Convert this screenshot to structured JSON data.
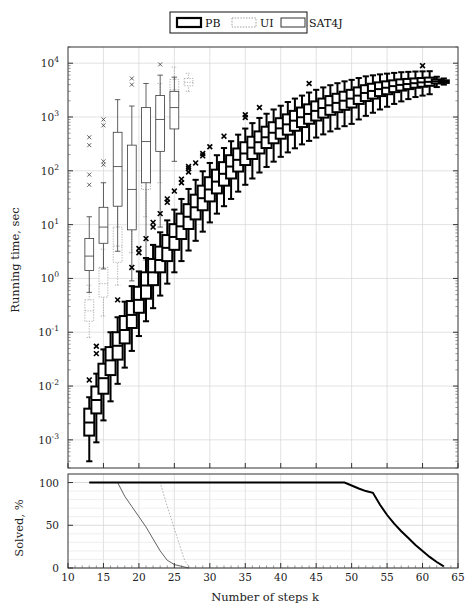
{
  "chart_data": {
    "type": "box",
    "title": "",
    "xlabel": "Number of steps k",
    "ylabel": "Running time, sec",
    "xlim": [
      10,
      65
    ],
    "xticks": [
      10,
      15,
      20,
      25,
      30,
      35,
      40,
      45,
      50,
      55,
      60,
      65
    ],
    "xticklabels": [
      "10",
      "15",
      "20",
      "25",
      "30",
      "35",
      "40",
      "45",
      "50",
      "55",
      "60",
      "65"
    ],
    "yscale": "log",
    "ylim": [
      0.0003,
      20000
    ],
    "yticks": [
      0.001,
      0.01,
      0.1,
      1,
      10,
      100,
      1000,
      10000
    ],
    "yticklabels": [
      "10^-3",
      "10^-2",
      "10^-1",
      "10^0",
      "10^1",
      "10^2",
      "10^3",
      "10^4"
    ],
    "grid": true,
    "legend_position": "top-center",
    "legend": [
      {
        "label": "PB",
        "style": "thick-solid",
        "color": "#000000",
        "linewidth": 2.2
      },
      {
        "label": "UI",
        "style": "dotted",
        "color": "#9a9a9a",
        "linewidth": 0.9
      },
      {
        "label": "SAT4J",
        "style": "thin-solid",
        "color": "#555555",
        "linewidth": 0.9
      }
    ],
    "series": [
      {
        "name": "PB",
        "style": "thick-solid",
        "boxes": [
          {
            "k": 13,
            "whislo": 0.0004,
            "q1": 0.0012,
            "med": 0.0021,
            "q3": 0.0038,
            "whishi": 0.0062,
            "outliers": [
              0.013
            ]
          },
          {
            "k": 14,
            "whislo": 0.0009,
            "q1": 0.0031,
            "med": 0.0055,
            "q3": 0.0098,
            "whishi": 0.017,
            "outliers": [
              0.04,
              0.055
            ]
          },
          {
            "k": 15,
            "whislo": 0.0023,
            "q1": 0.0072,
            "med": 0.014,
            "q3": 0.026,
            "whishi": 0.048,
            "outliers": []
          },
          {
            "k": 16,
            "whislo": 0.0052,
            "q1": 0.016,
            "med": 0.03,
            "q3": 0.053,
            "whishi": 0.1,
            "outliers": []
          },
          {
            "k": 17,
            "whislo": 0.011,
            "q1": 0.031,
            "med": 0.056,
            "q3": 0.1,
            "whishi": 0.19,
            "outliers": [
              0.4
            ]
          },
          {
            "k": 18,
            "whislo": 0.022,
            "q1": 0.062,
            "med": 0.11,
            "q3": 0.2,
            "whishi": 0.37,
            "outliers": []
          },
          {
            "k": 19,
            "whislo": 0.045,
            "q1": 0.12,
            "med": 0.21,
            "q3": 0.38,
            "whishi": 0.72,
            "outliers": [
              1.6
            ]
          },
          {
            "k": 20,
            "whislo": 0.085,
            "q1": 0.23,
            "med": 0.4,
            "q3": 0.7,
            "whishi": 1.35,
            "outliers": [
              3.0,
              3.6
            ]
          },
          {
            "k": 21,
            "whislo": 0.16,
            "q1": 0.42,
            "med": 0.74,
            "q3": 1.3,
            "whishi": 2.4,
            "outliers": [
              5.5
            ]
          },
          {
            "k": 22,
            "whislo": 0.28,
            "q1": 0.75,
            "med": 1.3,
            "q3": 2.3,
            "whishi": 4.2,
            "outliers": [
              9.0,
              11.0
            ]
          },
          {
            "k": 23,
            "whislo": 0.48,
            "q1": 1.3,
            "med": 2.2,
            "q3": 3.9,
            "whishi": 7.2,
            "outliers": [
              16.0
            ]
          },
          {
            "k": 24,
            "whislo": 0.8,
            "q1": 2.1,
            "med": 3.7,
            "q3": 6.4,
            "whishi": 12.0,
            "outliers": [
              26.0,
              30.0
            ]
          },
          {
            "k": 25,
            "whislo": 1.3,
            "q1": 3.4,
            "med": 5.9,
            "q3": 10.2,
            "whishi": 19.0,
            "outliers": [
              42.0
            ]
          },
          {
            "k": 26,
            "whislo": 2.1,
            "q1": 5.4,
            "med": 9.3,
            "q3": 16.0,
            "whishi": 30.0,
            "outliers": [
              60.0,
              70.0
            ]
          },
          {
            "k": 27,
            "whislo": 3.3,
            "q1": 8.3,
            "med": 14.0,
            "q3": 24.0,
            "whishi": 46.0,
            "outliers": [
              95.0,
              110.0,
              120.0
            ]
          },
          {
            "k": 28,
            "whislo": 5.0,
            "q1": 12.5,
            "med": 21.0,
            "q3": 36.0,
            "whishi": 68.0,
            "outliers": [
              140.0
            ]
          },
          {
            "k": 29,
            "whislo": 7.4,
            "q1": 18.5,
            "med": 31.0,
            "q3": 53.0,
            "whishi": 98.0,
            "outliers": [
              190.0,
              210.0
            ]
          },
          {
            "k": 30,
            "whislo": 11.0,
            "q1": 27.0,
            "med": 45.0,
            "q3": 76.0,
            "whishi": 140.0,
            "outliers": [
              280.0
            ]
          },
          {
            "k": 31,
            "whislo": 16.0,
            "q1": 38.0,
            "med": 63.0,
            "q3": 105.0,
            "whishi": 195.0,
            "outliers": []
          },
          {
            "k": 32,
            "whislo": 22.0,
            "q1": 53.0,
            "med": 88.0,
            "q3": 145.0,
            "whishi": 265.0,
            "outliers": [
              440.0
            ]
          },
          {
            "k": 33,
            "whislo": 30.0,
            "q1": 72.0,
            "med": 120.0,
            "q3": 195.0,
            "whishi": 355.0,
            "outliers": []
          },
          {
            "k": 34,
            "whislo": 41.0,
            "q1": 97.0,
            "med": 160.0,
            "q3": 260.0,
            "whishi": 470.0,
            "outliers": []
          },
          {
            "k": 35,
            "whislo": 55.0,
            "q1": 128.0,
            "med": 210.0,
            "q3": 340.0,
            "whishi": 610.0,
            "outliers": [
              980.0,
              1100.0
            ]
          },
          {
            "k": 36,
            "whislo": 72.0,
            "q1": 166.0,
            "med": 270.0,
            "q3": 430.0,
            "whishi": 770.0,
            "outliers": []
          },
          {
            "k": 37,
            "whislo": 93.0,
            "q1": 210.0,
            "med": 340.0,
            "q3": 540.0,
            "whishi": 960.0,
            "outliers": [
              1500.0
            ]
          },
          {
            "k": 38,
            "whislo": 118.0,
            "q1": 265.0,
            "med": 420.0,
            "q3": 660.0,
            "whishi": 1150.0,
            "outliers": []
          },
          {
            "k": 39,
            "whislo": 148.0,
            "q1": 325.0,
            "med": 510.0,
            "q3": 800.0,
            "whishi": 1380.0,
            "outliers": []
          },
          {
            "k": 40,
            "whislo": 182.0,
            "q1": 395.0,
            "med": 615.0,
            "q3": 950.0,
            "whishi": 1620.0,
            "outliers": []
          },
          {
            "k": 41,
            "whislo": 220.0,
            "q1": 470.0,
            "med": 730.0,
            "q3": 1120.0,
            "whishi": 1900.0,
            "outliers": []
          },
          {
            "k": 42,
            "whislo": 262.0,
            "q1": 555.0,
            "med": 855.0,
            "q3": 1300.0,
            "whishi": 2200.0,
            "outliers": []
          },
          {
            "k": 43,
            "whislo": 310.0,
            "q1": 650.0,
            "med": 990.0,
            "q3": 1500.0,
            "whishi": 2500.0,
            "outliers": []
          },
          {
            "k": 44,
            "whislo": 360.0,
            "q1": 750.0,
            "med": 1140.0,
            "q3": 1720.0,
            "whishi": 2850.0,
            "outliers": [
              4200.0
            ]
          },
          {
            "k": 45,
            "whislo": 415.0,
            "q1": 860.0,
            "med": 1300.0,
            "q3": 1950.0,
            "whishi": 3200.0,
            "outliers": []
          },
          {
            "k": 46,
            "whislo": 475.0,
            "q1": 975.0,
            "med": 1470.0,
            "q3": 2200.0,
            "whishi": 3550.0,
            "outliers": []
          },
          {
            "k": 47,
            "whislo": 540.0,
            "q1": 1100.0,
            "med": 1650.0,
            "q3": 2450.0,
            "whishi": 3900.0,
            "outliers": []
          },
          {
            "k": 48,
            "whislo": 605.0,
            "q1": 1230.0,
            "med": 1830.0,
            "q3": 2700.0,
            "whishi": 4250.0,
            "outliers": []
          },
          {
            "k": 49,
            "whislo": 675.0,
            "q1": 1360.0,
            "med": 2010.0,
            "q3": 2950.0,
            "whishi": 4600.0,
            "outliers": []
          },
          {
            "k": 50,
            "whislo": 745.0,
            "q1": 1500.0,
            "med": 2200.0,
            "q3": 3200.0,
            "whishi": 4900.0,
            "outliers": []
          },
          {
            "k": 51,
            "whislo": 900.0,
            "q1": 1750.0,
            "med": 2500.0,
            "q3": 3550.0,
            "whishi": 5300.0,
            "outliers": []
          },
          {
            "k": 52,
            "whislo": 1050.0,
            "q1": 1980.0,
            "med": 2800.0,
            "q3": 3900.0,
            "whishi": 5700.0,
            "outliers": []
          },
          {
            "k": 53,
            "whislo": 1200.0,
            "q1": 2200.0,
            "med": 3050.0,
            "q3": 4150.0,
            "whishi": 5950.0,
            "outliers": []
          },
          {
            "k": 54,
            "whislo": 1380.0,
            "q1": 2450.0,
            "med": 3300.0,
            "q3": 4400.0,
            "whishi": 6200.0,
            "outliers": []
          },
          {
            "k": 55,
            "whislo": 1550.0,
            "q1": 2650.0,
            "med": 3500.0,
            "q3": 4600.0,
            "whishi": 6400.0,
            "outliers": []
          },
          {
            "k": 56,
            "whislo": 1750.0,
            "q1": 2900.0,
            "med": 3750.0,
            "q3": 4800.0,
            "whishi": 6600.0,
            "outliers": []
          },
          {
            "k": 57,
            "whislo": 1950.0,
            "q1": 3100.0,
            "med": 3950.0,
            "q3": 5000.0,
            "whishi": 6800.0,
            "outliers": []
          },
          {
            "k": 58,
            "whislo": 2150.0,
            "q1": 3300.0,
            "med": 4100.0,
            "q3": 5100.0,
            "whishi": 6900.0,
            "outliers": []
          },
          {
            "k": 59,
            "whislo": 2350.0,
            "q1": 3500.0,
            "med": 4250.0,
            "q3": 5200.0,
            "whishi": 7000.0,
            "outliers": []
          },
          {
            "k": 60,
            "whislo": 2500.0,
            "q1": 3650.0,
            "med": 4400.0,
            "q3": 5300.0,
            "whishi": 7050.0,
            "outliers": [
              9000.0
            ]
          },
          {
            "k": 61,
            "whislo": 2650.0,
            "q1": 3800.0,
            "med": 4500.0,
            "q3": 5400.0,
            "whishi": 7100.0,
            "outliers": []
          },
          {
            "k": 62,
            "whislo": 3600.0,
            "q1": 4200.0,
            "med": 4600.0,
            "q3": 5000.0,
            "whishi": 5600.0,
            "outliers": []
          },
          {
            "k": 63,
            "whislo": 4000.0,
            "q1": 4300.0,
            "med": 4550.0,
            "q3": 4800.0,
            "whishi": 5200.0,
            "outliers": []
          }
        ]
      },
      {
        "name": "SAT4J",
        "style": "thin-solid",
        "boxes": [
          {
            "k": 13,
            "whislo": 0.55,
            "q1": 1.4,
            "med": 2.6,
            "q3": 5.5,
            "whishi": 14.0,
            "outliers": [
              55.0,
              85.0,
              300.0,
              420.0
            ]
          },
          {
            "k": 15,
            "whislo": 1.5,
            "q1": 4.5,
            "med": 9.0,
            "q3": 21.0,
            "whishi": 60.0,
            "outliers": [
              130.0,
              150.0,
              700.0,
              900.0
            ]
          },
          {
            "k": 17,
            "whislo": 3.2,
            "q1": 22.0,
            "med": 120.0,
            "q3": 520.0,
            "whishi": 2100.0,
            "outliers": []
          },
          {
            "k": 19,
            "whislo": 0.9,
            "q1": 8.0,
            "med": 45.0,
            "q3": 300.0,
            "whishi": 1600.0,
            "outliers": [
              4000.0,
              5200.0
            ]
          },
          {
            "k": 21,
            "whislo": 2.2,
            "q1": 60.0,
            "med": 350.0,
            "q3": 1500.0,
            "whishi": 4200.0,
            "outliers": []
          },
          {
            "k": 23,
            "whislo": 9.0,
            "q1": 230.0,
            "med": 900.0,
            "q3": 2500.0,
            "whishi": 6000.0,
            "outliers": [
              9500.0
            ]
          },
          {
            "k": 25,
            "whislo": 150.0,
            "q1": 600.0,
            "med": 1500.0,
            "q3": 3000.0,
            "whishi": 5500.0,
            "outliers": []
          }
        ]
      },
      {
        "name": "UI",
        "style": "dotted",
        "boxes": [
          {
            "k": 13,
            "whislo": 0.08,
            "q1": 0.16,
            "med": 0.25,
            "q3": 0.4,
            "whishi": 0.75,
            "outliers": []
          },
          {
            "k": 15,
            "whislo": 0.2,
            "q1": 0.45,
            "med": 0.8,
            "q3": 1.6,
            "whishi": 3.5,
            "outliers": []
          },
          {
            "k": 17,
            "whislo": 0.75,
            "q1": 2.0,
            "med": 4.0,
            "q3": 9.0,
            "whishi": 22.0,
            "outliers": []
          },
          {
            "k": 19,
            "whislo": 3.0,
            "q1": 9.0,
            "med": 20.0,
            "q3": 48.0,
            "whishi": 120.0,
            "outliers": []
          },
          {
            "k": 21,
            "whislo": 14.0,
            "q1": 45.0,
            "med": 110.0,
            "q3": 270.0,
            "whishi": 700.0,
            "outliers": []
          },
          {
            "k": 23,
            "whislo": 60.0,
            "q1": 260.0,
            "med": 650.0,
            "q3": 1600.0,
            "whishi": 4200.0,
            "outliers": []
          },
          {
            "k": 25,
            "whislo": 900.0,
            "q1": 2000.0,
            "med": 3200.0,
            "q3": 5000.0,
            "whishi": 8500.0,
            "outliers": []
          },
          {
            "k": 27,
            "whislo": 3000.0,
            "q1": 3800.0,
            "med": 4400.0,
            "q3": 5200.0,
            "whishi": 6500.0,
            "outliers": []
          }
        ]
      }
    ]
  },
  "solved_panel": {
    "ylabel": "Solved, %",
    "ylim": [
      0,
      110
    ],
    "yticks": [
      0,
      50,
      100
    ],
    "yticklabels": [
      "0",
      "50",
      "100"
    ],
    "grid": true,
    "curves": [
      {
        "name": "SAT4J",
        "style": "thin-solid",
        "points": [
          [
            13,
            100
          ],
          [
            15,
            100
          ],
          [
            17,
            100
          ],
          [
            18,
            84
          ],
          [
            19,
            72
          ],
          [
            20,
            60
          ],
          [
            21,
            48
          ],
          [
            22,
            34
          ],
          [
            23,
            20
          ],
          [
            24,
            9
          ],
          [
            25,
            4
          ],
          [
            26,
            2
          ],
          [
            27,
            0
          ]
        ]
      },
      {
        "name": "UI",
        "style": "dotted",
        "points": [
          [
            13,
            100
          ],
          [
            18,
            100
          ],
          [
            21,
            100
          ],
          [
            22,
            100
          ],
          [
            23,
            100
          ],
          [
            24,
            72
          ],
          [
            25,
            46
          ],
          [
            26,
            20
          ],
          [
            26.5,
            8
          ],
          [
            27,
            2
          ],
          [
            27.3,
            0
          ]
        ]
      },
      {
        "name": "PB",
        "style": "thick-solid",
        "points": [
          [
            13,
            100
          ],
          [
            20,
            100
          ],
          [
            30,
            100
          ],
          [
            40,
            100
          ],
          [
            47,
            100
          ],
          [
            49,
            100
          ],
          [
            51,
            93
          ],
          [
            52,
            90
          ],
          [
            53,
            88
          ],
          [
            54,
            74
          ],
          [
            55,
            62
          ],
          [
            56,
            52
          ],
          [
            57,
            43
          ],
          [
            58,
            35
          ],
          [
            59,
            27
          ],
          [
            60,
            20
          ],
          [
            61,
            13
          ],
          [
            62,
            7
          ],
          [
            63,
            2
          ]
        ]
      }
    ]
  }
}
